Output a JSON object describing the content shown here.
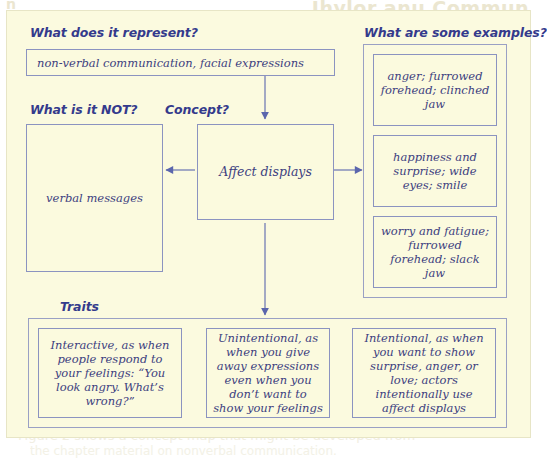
{
  "page": {
    "bleed_text": {
      "top_right": "Ihylor anu Commun",
      "top_left": "n",
      "middle": "a concept map of a concept you are studying",
      "bottom_1": "Figure 2 shows a concept map that might be developed from",
      "bottom_2": "the chapter material on nonverbal communication."
    }
  },
  "diagram": {
    "sections": {
      "represent": {
        "heading": "What does it represent?",
        "box_text": "non-verbal communication, facial expressions"
      },
      "not": {
        "heading": "What is it NOT?",
        "box_text": "verbal messages"
      },
      "concept": {
        "heading": "Concept?",
        "box_text": "Affect displays"
      },
      "examples": {
        "heading": "What are some examples?",
        "items": [
          "anger; furrowed forehead; clinched jaw",
          "happiness and surprise; wide eyes; smile",
          "worry and fatigue; furrowed forehead; slack jaw"
        ]
      },
      "traits": {
        "heading": "Traits",
        "items": [
          "Interactive, as when people respond to your feelings: “You look angry. What’s wrong?”",
          "Unintentional, as when you give away expressions even when you don’t want to show your feelings",
          "Intentional, as when you want to show surprise, anger, or love; actors intentionally use affect displays"
        ]
      }
    },
    "arrows": [
      {
        "name": "arrow-represent-to-concept",
        "direction": "down"
      },
      {
        "name": "arrow-concept-to-not",
        "direction": "left"
      },
      {
        "name": "arrow-concept-to-examples",
        "direction": "right"
      },
      {
        "name": "arrow-concept-to-traits",
        "direction": "down"
      }
    ],
    "colors": {
      "card_background": "#fbfadf",
      "box_border": "#8b93c0",
      "text": "#3d3f80",
      "heading": "#343a8c",
      "arrow": "#5b66ad"
    }
  }
}
